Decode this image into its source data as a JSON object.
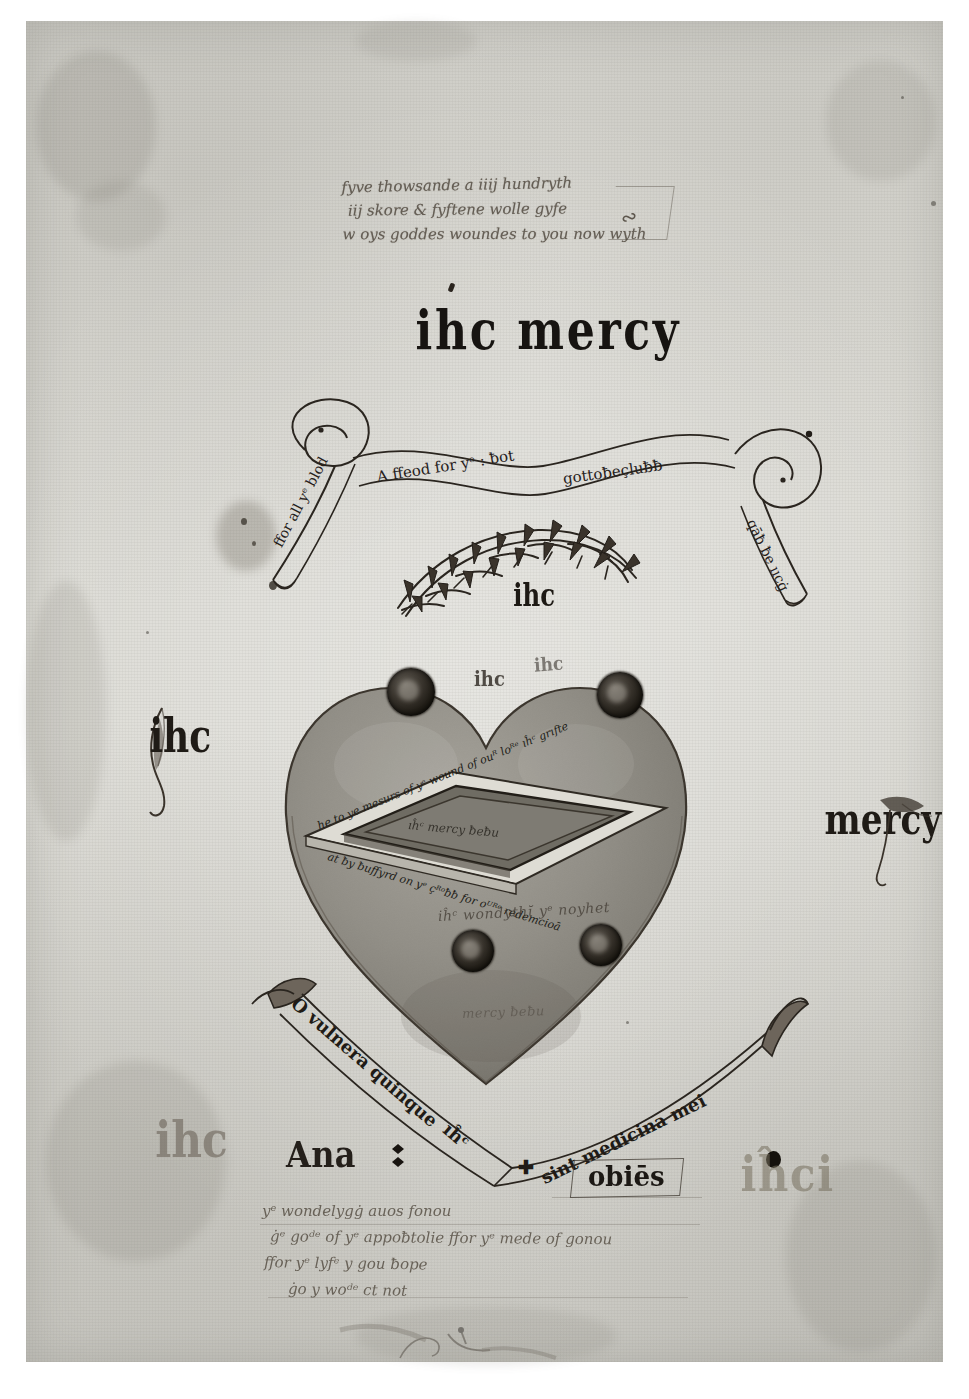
{
  "page": {
    "kind": "manuscript-leaf",
    "parchment_color": "#d8d7d1",
    "ink_color": "#1a1714",
    "wash_color": "#8d8b84"
  },
  "top_note": {
    "lines": [
      "fyve thowsande a iiij hundryth",
      "iij skore & fyftene wolle gyfe",
      "w oys goddes woundes to you now wyth"
    ]
  },
  "heading": {
    "text": "ihc mercy"
  },
  "banner_top": {
    "left_tail_text": "ffor all yᵉ blod",
    "mid_left_text": "A ffeod for yᵉ : ƀot",
    "mid_right_text": "gottoƀeçluƀƀ",
    "right_tail_text": "qāƀ ƀe ııcġ"
  },
  "crown": {
    "name": "crown-of-thorns",
    "ihc_label": "ihc"
  },
  "heart": {
    "top_left_ihc": "ihc",
    "top_right_ihc": "ihc",
    "below_wound_text": "iĥᶜ wondythῐ yᵉ noyhet",
    "bottom_faint_text": "mercy ƀeƀu",
    "wounds": [
      {
        "name": "wound-upper-left"
      },
      {
        "name": "wound-upper-right"
      },
      {
        "name": "wound-lower-left"
      },
      {
        "name": "wound-lower-right"
      }
    ],
    "lozenge": {
      "top_band_text": "he to ye mesurs of yᵉ wound of ouᴿ loᴿᵉ ıĥᶜ grıfte",
      "bottom_band_text": "at ƀy ƀuffyrd on yᵉ çᴿᵒƀƀ for oᵁᴿᵉ redemcioā",
      "inner_text": "ıĥᶜ mercy ƀeƀu"
    }
  },
  "margins": {
    "left_ihc": "ihc",
    "right_mercy": "mercy"
  },
  "banner_bottom": {
    "left_text": "O vulnera quinque",
    "mid_text": "ıĥᶜ",
    "right_text": "sint medicina mei"
  },
  "bottom_row": {
    "faded_ihc": "ihc",
    "ana_word": "Ana",
    "obies_word": "obiēs",
    "faded_ihci": "iĥci"
  },
  "bottom_note": {
    "lines": [
      "yᵉ wondelygġ auos fonou",
      "ġᵉ goᵈᵉ of yᵉ appoƀtolie ffor yᵉ mede of gonou",
      "ffor yᵉ lyfᵉ y gou ƀope",
      "ġo y woᵈᵉ ct not"
    ]
  }
}
